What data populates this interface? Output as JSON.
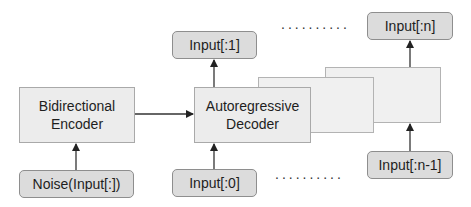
{
  "diagram": {
    "encoder": {
      "line1": "Bidirectional",
      "line2": "Encoder"
    },
    "decoder": {
      "line1": "Autoregressive",
      "line2": "Decoder"
    },
    "encoder_input": "Noise(Input[:])",
    "decoder_inputs": {
      "first": "Input[:0]",
      "last": "Input[:n-1]"
    },
    "decoder_outputs": {
      "first": "Input[:1]",
      "last": "Input[:n]"
    },
    "ellipsis_top": "..........",
    "ellipsis_bottom": ".........."
  },
  "colors": {
    "box_fill": "#ececec",
    "pill_fill": "#dcdcdc",
    "border": "#a9a9a9",
    "arrow": "#222222"
  }
}
